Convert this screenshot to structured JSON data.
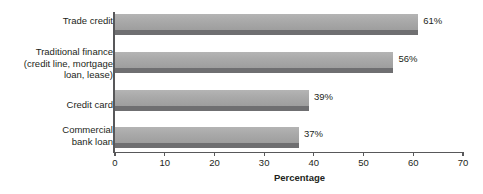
{
  "chart_data": {
    "type": "bar",
    "orientation": "horizontal",
    "title": "",
    "xlabel": "Percentage",
    "ylabel": "",
    "categories": [
      "Trade credit",
      "Traditional finance\n(credit line, mortgage\nloan, lease)",
      "Credit card",
      "Commercial\nbank loan"
    ],
    "values": [
      61,
      56,
      39,
      37
    ],
    "data_labels": [
      "61%",
      "56%",
      "39%",
      "37%"
    ],
    "xlim": [
      0,
      70
    ],
    "xticks": [
      0,
      10,
      20,
      30,
      40,
      50,
      60,
      70
    ],
    "xtick_labels": [
      "0",
      "10",
      "20",
      "30",
      "40",
      "50",
      "60",
      "70"
    ],
    "grid": false,
    "legend": null,
    "colors": {
      "bar_fill": "#a9a9a9",
      "bar_shadow": "#6f6f71",
      "axis": "#58585a",
      "text": "#231f20",
      "background": "#ffffff"
    }
  }
}
